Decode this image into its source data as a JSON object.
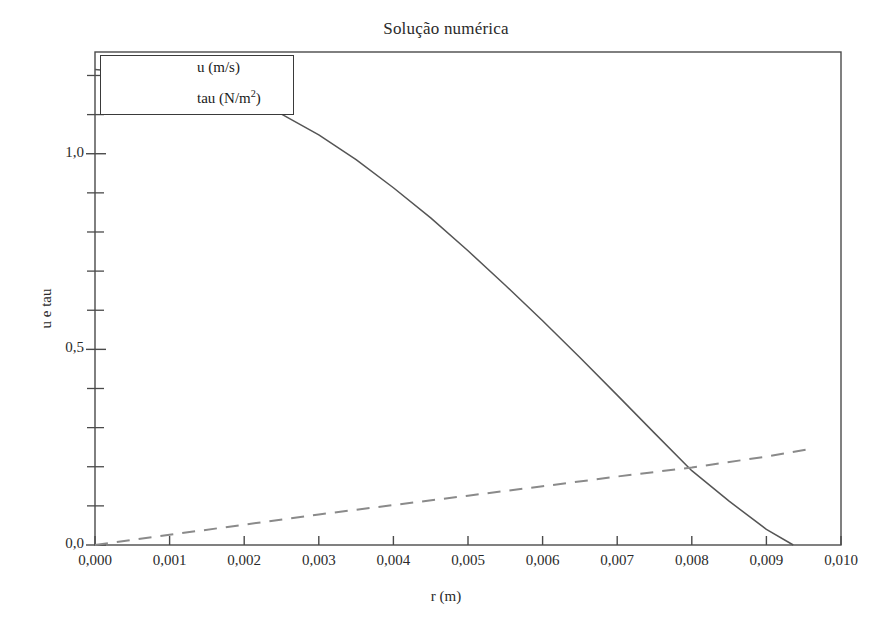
{
  "chart_data": {
    "type": "line",
    "title": "Solução numérica",
    "xlabel": "r (m)",
    "ylabel": "u e tau",
    "xlim": [
      0.0,
      0.01
    ],
    "ylim": [
      0.0,
      1.26
    ],
    "grid": false,
    "legend_position": "upper left",
    "xticks": [
      0.0,
      0.001,
      0.002,
      0.003,
      0.004,
      0.005,
      0.006,
      0.007,
      0.008,
      0.009,
      0.01
    ],
    "xtick_labels": [
      "0,000",
      "0,001",
      "0,002",
      "0,003",
      "0,004",
      "0,005",
      "0,006",
      "0,007",
      "0,008",
      "0,009",
      "0,010"
    ],
    "yticks": [
      0.0,
      0.5,
      1.0
    ],
    "ytick_labels": [
      "0,0",
      "0,5",
      "1,0"
    ],
    "yminor_ticks": [
      0.1,
      0.2,
      0.3,
      0.4,
      0.6,
      0.7,
      0.8,
      0.9,
      1.1,
      1.2
    ],
    "series": [
      {
        "name": "u (m/s)",
        "style": "solid",
        "color": "#555555",
        "x": [
          0.0,
          0.0005,
          0.001,
          0.0015,
          0.002,
          0.0025,
          0.003,
          0.0035,
          0.004,
          0.0045,
          0.005,
          0.0055,
          0.006,
          0.0065,
          0.007,
          0.0075,
          0.008,
          0.0085,
          0.009,
          0.00936
        ],
        "y": [
          1.215,
          1.207,
          1.193,
          1.171,
          1.142,
          1.101,
          1.048,
          0.985,
          0.913,
          0.836,
          0.752,
          0.664,
          0.573,
          0.479,
          0.383,
          0.286,
          0.19,
          0.112,
          0.04,
          0.0
        ]
      },
      {
        "name": "tau (N/m²)",
        "style": "dashed",
        "color": "#8a8a8a",
        "x": [
          0.0,
          0.001,
          0.002,
          0.003,
          0.004,
          0.005,
          0.006,
          0.007,
          0.008,
          0.009,
          0.0096
        ],
        "y": [
          0.0,
          0.026,
          0.052,
          0.078,
          0.102,
          0.126,
          0.15,
          0.175,
          0.198,
          0.226,
          0.246
        ]
      }
    ]
  },
  "legend": {
    "items": [
      {
        "label_prefix": "u (m/s)",
        "label_sup": "",
        "label_suffix": ""
      },
      {
        "label_prefix": "tau (N/m",
        "label_sup": "2",
        "label_suffix": ")"
      }
    ]
  }
}
